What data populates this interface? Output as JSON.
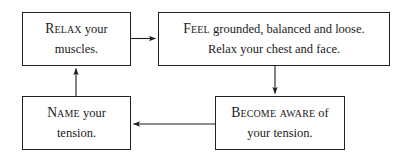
{
  "diagram": {
    "type": "cycle-flowchart",
    "title": "",
    "background_color": "#ffffff",
    "line_color": "#231f20",
    "text_color": "#1a1a1a",
    "nodes": [
      {
        "id": "relax",
        "name": "relax-your-muscles",
        "lines": [
          {
            "smallcaps": "Relax",
            "rest": " your"
          },
          {
            "smallcaps": "",
            "rest": "muscles."
          }
        ]
      },
      {
        "id": "feel",
        "name": "feel-grounded",
        "lines": [
          {
            "smallcaps": "Feel",
            "rest": " grounded, balanced and loose."
          },
          {
            "smallcaps": "",
            "rest": "Relax your chest and face."
          }
        ]
      },
      {
        "id": "become",
        "name": "become-aware",
        "lines": [
          {
            "smallcaps": "Become aware",
            "rest": " of"
          },
          {
            "smallcaps": "",
            "rest": "your tension."
          }
        ]
      },
      {
        "id": "name",
        "name": "name-your-tension",
        "lines": [
          {
            "smallcaps": "Name",
            "rest": " your"
          },
          {
            "smallcaps": "",
            "rest": "tension."
          }
        ]
      }
    ],
    "connectors": [
      {
        "name": "arrow-relax-to-feel",
        "from": "relax",
        "to": "feel",
        "direction": "right"
      },
      {
        "name": "arrow-feel-to-become",
        "from": "feel",
        "to": "become",
        "direction": "down"
      },
      {
        "name": "arrow-become-to-name",
        "from": "become",
        "to": "name",
        "direction": "left"
      },
      {
        "name": "arrow-name-to-relax",
        "from": "name",
        "to": "relax",
        "direction": "up"
      }
    ]
  }
}
